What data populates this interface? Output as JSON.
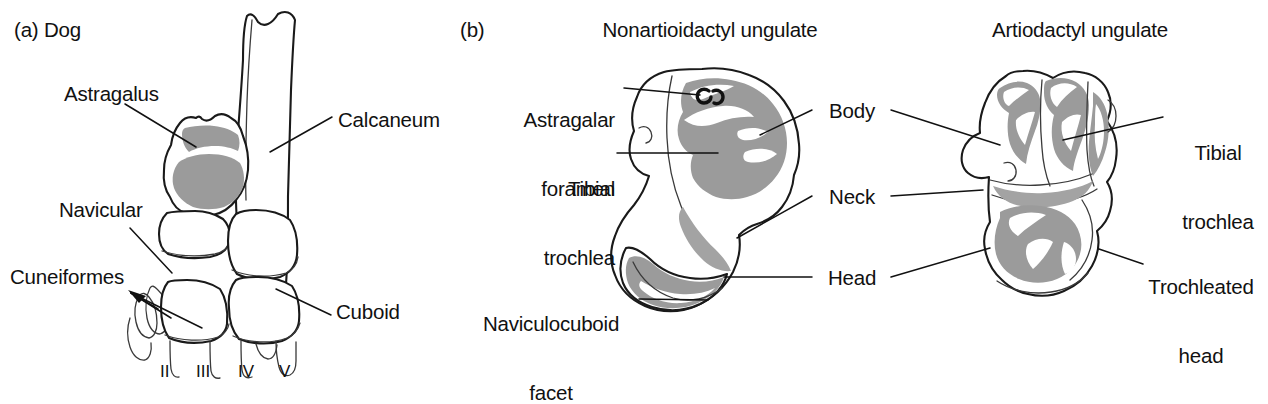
{
  "figure": {
    "background_color": "#ffffff",
    "ink_color": "#111111",
    "cartilage_color": "#9b9b9b"
  },
  "panels": [
    {
      "tag": "(a)",
      "title": "Dog",
      "tag_and_title": "(a) Dog",
      "labels": [
        {
          "text": "Astragalus",
          "name": "label-astragalus"
        },
        {
          "text": "Calcaneum",
          "name": "label-calcaneum"
        },
        {
          "text": "Navicular",
          "name": "label-navicular"
        },
        {
          "text": "Cuneiformes",
          "name": "label-cuneiformes"
        },
        {
          "text": "Cuboid",
          "name": "label-cuboid"
        }
      ],
      "metatarsal_numerals": [
        "II",
        "III",
        "IV",
        "V"
      ]
    },
    {
      "tag": "(b)",
      "title_left": "Nonartioidactyl ungulate",
      "title_right": "Artiodactyl ungulate",
      "labels_left": [
        {
          "line1": "Astragalar",
          "line2": "foramen",
          "text": "Astragalar foramen",
          "name": "label-astragalar-foramen"
        },
        {
          "line1": "Tibial",
          "line2": "trochlea",
          "text": "Tibial trochlea",
          "name": "label-tibial-trochlea-left"
        },
        {
          "line1": "Naviculocuboid",
          "line2": "facet",
          "text": "Naviculocuboid facet",
          "name": "label-naviculocuboid-facet"
        }
      ],
      "labels_center": [
        {
          "text": "Body",
          "name": "label-body"
        },
        {
          "text": "Neck",
          "name": "label-neck"
        },
        {
          "text": "Head",
          "name": "label-head"
        }
      ],
      "labels_right": [
        {
          "line1": "Tibial",
          "line2": "trochlea",
          "text": "Tibial trochlea",
          "name": "label-tibial-trochlea-right"
        },
        {
          "line1": "Trochleated",
          "line2": "head",
          "text": "Trochleated head",
          "name": "label-trochleated-head"
        }
      ]
    }
  ]
}
